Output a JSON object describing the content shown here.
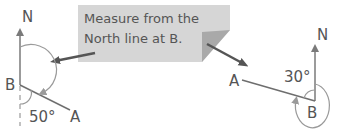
{
  "callout": {
    "line1": "Measure from the",
    "line2": "North line at B."
  },
  "left_diagram": {
    "north_label": "N",
    "point_b_label": "B",
    "point_a_label": "A",
    "angle_label": "50°"
  },
  "right_diagram": {
    "north_label": "N",
    "point_b_label": "B",
    "point_a_label": "A",
    "angle_label": "30°"
  },
  "colors": {
    "line": "#6e6e6e",
    "arc": "#9a9a9a",
    "callout_fill": "#d6d6d6",
    "callout_fold": "#a9a9a9",
    "pointer_arrow": "#555555",
    "text": "#555555"
  }
}
